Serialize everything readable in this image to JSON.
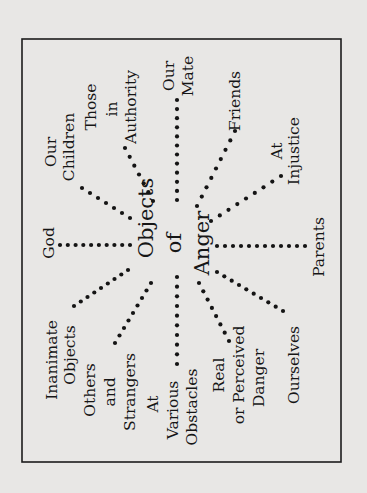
{
  "diagram": {
    "title_lines": [
      "Objects",
      "of",
      "Anger"
    ],
    "orientation": "rotated 90 degrees counter-clockwise",
    "colors": {
      "ink": "#161616",
      "paper": "#e8e7e5",
      "frame": "#1c1c1c"
    },
    "spokes": [
      {
        "id": "inanimate-objects",
        "lines": [
          "Inanimate",
          "Objects"
        ]
      },
      {
        "id": "god",
        "lines": [
          "God"
        ]
      },
      {
        "id": "our-children",
        "lines": [
          "Our",
          "Children"
        ]
      },
      {
        "id": "those-in-authority",
        "lines": [
          "Those",
          "in",
          "Authority"
        ]
      },
      {
        "id": "our-mate",
        "lines": [
          "Our",
          "Mate"
        ]
      },
      {
        "id": "friends",
        "lines": [
          "Friends"
        ]
      },
      {
        "id": "at-injustice",
        "lines": [
          "At",
          "Injustice"
        ]
      },
      {
        "id": "parents",
        "lines": [
          "Parents"
        ]
      },
      {
        "id": "ourselves",
        "lines": [
          "Ourselves"
        ]
      },
      {
        "id": "real-or-perceived-danger",
        "lines": [
          "Real",
          "or Perceived",
          "Danger"
        ]
      },
      {
        "id": "at-various-obstacles",
        "lines": [
          "At",
          "Various",
          "Obstacles"
        ]
      },
      {
        "id": "others-and-strangers",
        "lines": [
          "Others",
          "and",
          "Strangers"
        ]
      }
    ]
  }
}
